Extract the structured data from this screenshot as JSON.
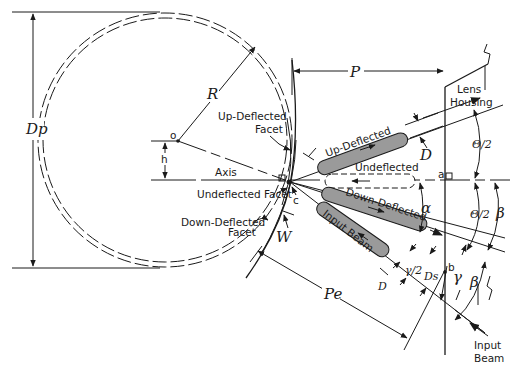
{
  "figure": {
    "type": "optical geometry diagram (polygon scanner facet deflection)",
    "colors": {
      "ink": "#1a1a1a",
      "background": "#ffffff",
      "beam_fill": "#9a9a9a"
    }
  },
  "labels": {
    "polygon_diameter": "Dp",
    "radius": "R",
    "offset_h": "h",
    "center_point": "o",
    "axis": "Axis",
    "up_deflected_facet": [
      "Up-Deflected",
      "Facet"
    ],
    "undeflected_facet": "Undeflected Facet",
    "down_deflected_facet": [
      "Down-Deflected",
      "Facet"
    ],
    "facet_width": "W",
    "contact_point": "c",
    "distance_p": "P",
    "distance_pe": "Pe",
    "lens_housing": [
      "Lens",
      "Housing"
    ],
    "up_deflected_beam": "Up-Deflected",
    "undeflected_beam": "Undeflected",
    "down_deflected_beam": "Down-Deflected",
    "input_beam_inner": "Input Beam",
    "input_beam_outer": [
      "Input",
      "Beam"
    ],
    "beam_diameter_upper": "D",
    "beam_diameter_lower": "D",
    "half_scan_angle_upper": "Θ/2",
    "half_scan_angle_lower": "Θ/2",
    "alpha": "α",
    "beta_upper": "β",
    "beta_lower": "β",
    "gamma": "γ",
    "gamma_half": "γ/2",
    "ds": "Ds",
    "point_a": "a",
    "point_b": "b"
  }
}
